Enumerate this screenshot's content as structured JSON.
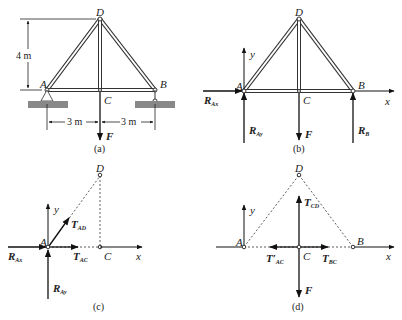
{
  "figure": {
    "panels": [
      {
        "id": "a",
        "caption": "(a)",
        "nodes": {
          "A": "A",
          "B": "B",
          "C": "C",
          "D": "D"
        },
        "dimensions": {
          "height": "4 m",
          "left_span": "3 m",
          "right_span": "3 m"
        },
        "load": "F"
      },
      {
        "id": "b",
        "caption": "(b)",
        "nodes": {
          "A": "A",
          "B": "B",
          "C": "C",
          "D": "D"
        },
        "axes": {
          "x": "x",
          "y": "y"
        },
        "forces": {
          "RAx": {
            "main": "R",
            "sub": "Ax"
          },
          "RAy": {
            "main": "R",
            "sub": "Ay"
          },
          "RB": {
            "main": "R",
            "sub": "B"
          },
          "F": "F"
        }
      },
      {
        "id": "c",
        "caption": "(c)",
        "nodes": {
          "A": "A",
          "C": "C",
          "D": "D"
        },
        "axes": {
          "x": "x",
          "y": "y"
        },
        "forces": {
          "RAx": {
            "main": "R",
            "sub": "Ax"
          },
          "RAy": {
            "main": "R",
            "sub": "Ay"
          },
          "TAD": {
            "main": "T",
            "sub": "AD"
          },
          "TAC": {
            "main": "T",
            "sub": "AC"
          }
        }
      },
      {
        "id": "d",
        "caption": "(d)",
        "nodes": {
          "A": "A",
          "B": "B",
          "C": "C",
          "D": "D"
        },
        "axes": {
          "x": "x",
          "y": "y"
        },
        "forces": {
          "TCD": {
            "main": "T",
            "sub": "CD"
          },
          "TAC_prime": {
            "main": "T′",
            "sub": "AC"
          },
          "TBC": {
            "main": "T",
            "sub": "BC"
          },
          "F": "F"
        }
      }
    ]
  }
}
